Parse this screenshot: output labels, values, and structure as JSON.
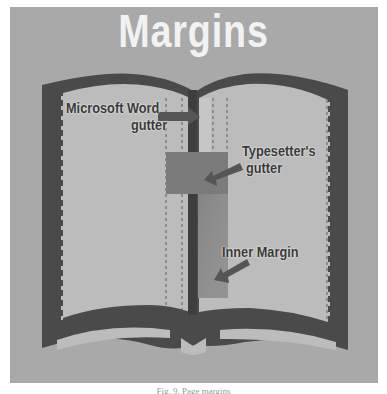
{
  "diagram": {
    "title": "Margins",
    "labels": {
      "word_gutter_line1": "Microsoft Word",
      "word_gutter_line2": "gutter",
      "typesetter_line1": "Typesetter's",
      "typesetter_line2": "gutter",
      "inner_margin": "Inner Margin"
    },
    "caption": "Fig. 9. Page margins",
    "colors": {
      "panel": "#a9a9a9",
      "title": "#f2f2f2",
      "book_outline": "#4a4a4a",
      "page": "#bcbcbc",
      "spine": "#3e3e3e",
      "typesetter_gutter": "#7b7b7b",
      "inner_margin": "#8e8e8e",
      "label_text": "#3a3a3a"
    }
  }
}
